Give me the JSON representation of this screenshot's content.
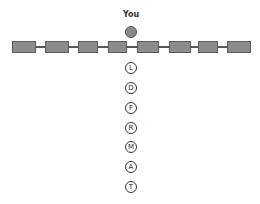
{
  "you": {
    "label": "You"
  },
  "train": {
    "cars": [
      {
        "left": 12,
        "width": 24
      },
      {
        "left": 45,
        "width": 24
      },
      {
        "left": 78,
        "width": 20
      },
      {
        "left": 108,
        "width": 19
      },
      {
        "left": 137,
        "width": 22
      },
      {
        "left": 169,
        "width": 22
      },
      {
        "left": 198,
        "width": 20
      },
      {
        "left": 227,
        "width": 24
      }
    ]
  },
  "letters": [
    {
      "label": "L",
      "top": 62
    },
    {
      "label": "D",
      "top": 82
    },
    {
      "label": "F",
      "top": 102
    },
    {
      "label": "R",
      "top": 122
    },
    {
      "label": "M",
      "top": 141
    },
    {
      "label": "A",
      "top": 161
    },
    {
      "label": "T",
      "top": 181
    }
  ],
  "colors": {
    "car": "#8c8c8c",
    "you_dot": "#8a8a8a"
  }
}
